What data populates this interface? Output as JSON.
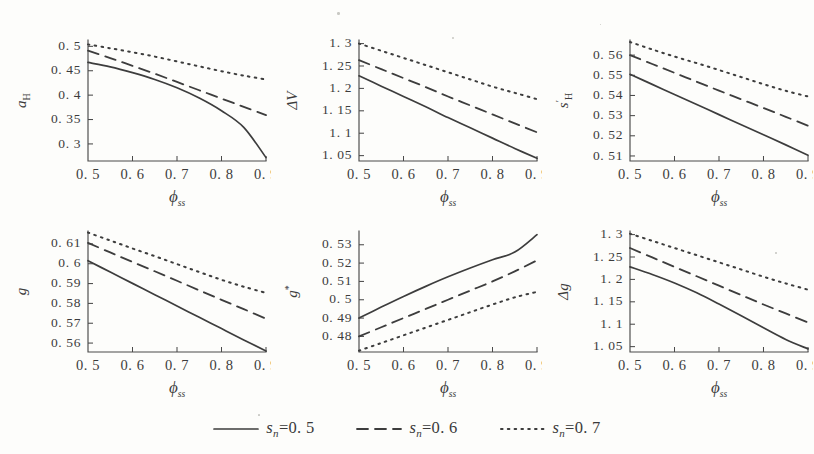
{
  "figure": {
    "background_color": "#fdfdfb",
    "ink_color": "#3d3d3d",
    "rows": 2,
    "columns": 3
  },
  "legend": {
    "position": "bottom-center",
    "items": [
      {
        "style": "solid",
        "label_symbol": "s",
        "label_sub": "n",
        "label_eq": "=0. 5",
        "full": "s_n=0.5",
        "value": 0.5
      },
      {
        "style": "dashed",
        "label_symbol": "s",
        "label_sub": "n",
        "label_eq": "=0. 6",
        "full": "s_n=0.6",
        "value": 0.6
      },
      {
        "style": "dotted",
        "label_symbol": "s",
        "label_sub": "n",
        "label_eq": "=0. 7",
        "full": "s_n=0.7",
        "value": 0.7
      }
    ]
  },
  "chart_data": [
    {
      "type": "line",
      "panel": 0,
      "title": "",
      "ylabel": "a_H",
      "ylabel_symbol": "a",
      "ylabel_sub": "H",
      "xlabel": "ϕ_ss",
      "xlabel_symbol": "ϕ",
      "xlabel_sub": "ss",
      "x": [
        0.5,
        0.55,
        0.6,
        0.65,
        0.7,
        0.75,
        0.8,
        0.85,
        0.9
      ],
      "xlim": [
        0.5,
        0.9
      ],
      "ylim": [
        0.265,
        0.513
      ],
      "xticks": [
        0.5,
        0.6,
        0.7,
        0.8,
        0.9
      ],
      "xticklabels": [
        "0. 5",
        "0. 6",
        "0. 7",
        "0. 8",
        "0. 9"
      ],
      "yticks": [
        0.3,
        0.35,
        0.4,
        0.45,
        0.5
      ],
      "yticklabels": [
        "0. 3",
        "0. 35",
        "0. 4",
        "0. 45",
        "0. 5"
      ],
      "grid": false,
      "series": [
        {
          "name": "s_n=0.5",
          "style": "solid",
          "values": [
            0.467,
            0.458,
            0.446,
            0.432,
            0.415,
            0.394,
            0.368,
            0.334,
            0.272
          ]
        },
        {
          "name": "s_n=0.6",
          "style": "dashed",
          "values": [
            0.491,
            0.476,
            0.46,
            0.444,
            0.427,
            0.41,
            0.393,
            0.376,
            0.359
          ]
        },
        {
          "name": "s_n=0.7",
          "style": "dotted",
          "values": [
            0.504,
            0.496,
            0.488,
            0.479,
            0.469,
            0.459,
            0.449,
            0.44,
            0.432
          ]
        }
      ]
    },
    {
      "type": "line",
      "panel": 1,
      "title": "",
      "ylabel": "ΔV",
      "ylabel_symbol": "ΔV",
      "ylabel_sub": "",
      "xlabel": "ϕ_ss",
      "xlabel_symbol": "ϕ",
      "xlabel_sub": "ss",
      "x": [
        0.5,
        0.55,
        0.6,
        0.65,
        0.7,
        0.75,
        0.8,
        0.85,
        0.9
      ],
      "xlim": [
        0.5,
        0.9
      ],
      "ylim": [
        1.038,
        1.308
      ],
      "xticks": [
        0.5,
        0.6,
        0.7,
        0.8,
        0.9
      ],
      "xticklabels": [
        "0. 5",
        "0. 6",
        "0. 7",
        "0. 8",
        "0. 9"
      ],
      "yticks": [
        1.05,
        1.1,
        1.15,
        1.2,
        1.25,
        1.3
      ],
      "yticklabels": [
        "1. 05",
        "1. 1",
        "1. 15",
        "1. 2",
        "1. 25",
        "1. 3"
      ],
      "grid": false,
      "series": [
        {
          "name": "s_n=0.5",
          "style": "solid",
          "values": [
            1.228,
            1.205,
            1.182,
            1.159,
            1.135,
            1.112,
            1.089,
            1.066,
            1.044
          ]
        },
        {
          "name": "s_n=0.6",
          "style": "dashed",
          "values": [
            1.263,
            1.243,
            1.223,
            1.203,
            1.182,
            1.162,
            1.142,
            1.122,
            1.102
          ]
        },
        {
          "name": "s_n=0.7",
          "style": "dotted",
          "values": [
            1.3,
            1.284,
            1.268,
            1.252,
            1.236,
            1.22,
            1.204,
            1.19,
            1.176
          ]
        }
      ]
    },
    {
      "type": "line",
      "panel": 2,
      "title": "",
      "ylabel": "s'_H",
      "ylabel_symbol": "s",
      "ylabel_sup": "′",
      "ylabel_sub": "H",
      "xlabel": "ϕ_ss",
      "xlabel_symbol": "ϕ",
      "xlabel_sub": "ss",
      "x": [
        0.5,
        0.55,
        0.6,
        0.65,
        0.7,
        0.75,
        0.8,
        0.85,
        0.9
      ],
      "xlim": [
        0.5,
        0.9
      ],
      "ylim": [
        0.5075,
        0.5675
      ],
      "xticks": [
        0.5,
        0.6,
        0.7,
        0.8,
        0.9
      ],
      "xticklabels": [
        "0. 5",
        "0. 6",
        "0. 7",
        "0. 8",
        "0. 9"
      ],
      "yticks": [
        0.51,
        0.52,
        0.53,
        0.54,
        0.55,
        0.56
      ],
      "yticklabels": [
        "0. 51",
        "0. 52",
        "0. 53",
        "0. 54",
        "0. 55",
        "0. 56"
      ],
      "grid": false,
      "series": [
        {
          "name": "s_n=0.5",
          "style": "solid",
          "values": [
            0.5505,
            0.5455,
            0.5405,
            0.5355,
            0.5305,
            0.5255,
            0.5205,
            0.5155,
            0.5103
          ]
        },
        {
          "name": "s_n=0.6",
          "style": "dashed",
          "values": [
            0.56,
            0.5556,
            0.5512,
            0.5468,
            0.5424,
            0.5381,
            0.5338,
            0.5294,
            0.525
          ]
        },
        {
          "name": "s_n=0.7",
          "style": "dotted",
          "values": [
            0.5665,
            0.5628,
            0.5593,
            0.556,
            0.5526,
            0.5491,
            0.5456,
            0.5423,
            0.5395
          ]
        }
      ]
    },
    {
      "type": "line",
      "panel": 3,
      "title": "",
      "ylabel": "g",
      "ylabel_symbol": "g",
      "ylabel_sub": "",
      "xlabel": "ϕ_ss",
      "xlabel_symbol": "ϕ",
      "xlabel_sub": "ss",
      "x": [
        0.5,
        0.55,
        0.6,
        0.65,
        0.7,
        0.75,
        0.8,
        0.85,
        0.9
      ],
      "xlim": [
        0.5,
        0.9
      ],
      "ylim": [
        0.5555,
        0.6165
      ],
      "xticks": [
        0.5,
        0.6,
        0.7,
        0.8,
        0.9
      ],
      "xticklabels": [
        "0. 5",
        "0. 6",
        "0. 7",
        "0. 8",
        "0. 9"
      ],
      "yticks": [
        0.56,
        0.57,
        0.58,
        0.59,
        0.6,
        0.61
      ],
      "yticklabels": [
        "0. 56",
        "0. 57",
        "0. 58",
        "0. 59",
        "0. 6",
        "0. 61"
      ],
      "grid": false,
      "series": [
        {
          "name": "s_n=0.5",
          "style": "solid",
          "values": [
            0.6015,
            0.5958,
            0.5901,
            0.5844,
            0.5787,
            0.573,
            0.5673,
            0.5616,
            0.556
          ]
        },
        {
          "name": "s_n=0.6",
          "style": "dashed",
          "values": [
            0.6105,
            0.6057,
            0.6009,
            0.5962,
            0.5914,
            0.5866,
            0.5818,
            0.5771,
            0.5723
          ]
        },
        {
          "name": "s_n=0.7",
          "style": "dotted",
          "values": [
            0.6157,
            0.6117,
            0.6077,
            0.6038,
            0.5998,
            0.5958,
            0.5919,
            0.5884,
            0.5853
          ]
        }
      ]
    },
    {
      "type": "line",
      "panel": 4,
      "title": "",
      "ylabel": "g*",
      "ylabel_symbol": "g",
      "ylabel_sup": "*",
      "ylabel_sub": "",
      "xlabel": "ϕ_ss",
      "xlabel_symbol": "ϕ",
      "xlabel_sub": "ss",
      "x": [
        0.5,
        0.55,
        0.6,
        0.65,
        0.7,
        0.75,
        0.8,
        0.85,
        0.9
      ],
      "xlim": [
        0.5,
        0.9
      ],
      "ylim": [
        0.4715,
        0.5375
      ],
      "xticks": [
        0.5,
        0.6,
        0.7,
        0.8,
        0.9
      ],
      "xticklabels": [
        "0. 5",
        "0. 6",
        "0. 7",
        "0. 8",
        "0. 9"
      ],
      "yticks": [
        0.48,
        0.49,
        0.5,
        0.51,
        0.52,
        0.53
      ],
      "yticklabels": [
        "0. 48",
        "0. 49",
        "0. 5",
        "0. 51",
        "0. 52",
        "0. 53"
      ],
      "grid": false,
      "series": [
        {
          "name": "s_n=0.5",
          "style": "solid",
          "values": [
            0.49,
            0.496,
            0.5018,
            0.5073,
            0.5125,
            0.5173,
            0.5218,
            0.526,
            0.5355
          ]
        },
        {
          "name": "s_n=0.6",
          "style": "dashed",
          "values": [
            0.48,
            0.485,
            0.49,
            0.495,
            0.5,
            0.505,
            0.51,
            0.5155,
            0.5215
          ]
        },
        {
          "name": "s_n=0.7",
          "style": "dotted",
          "values": [
            0.4722,
            0.4764,
            0.4806,
            0.4848,
            0.489,
            0.4932,
            0.4974,
            0.5013,
            0.5043
          ]
        }
      ]
    },
    {
      "type": "line",
      "panel": 5,
      "title": "",
      "ylabel": "Δg",
      "ylabel_symbol": "Δg",
      "ylabel_sub": "",
      "xlabel": "ϕ_ss",
      "xlabel_symbol": "ϕ",
      "xlabel_sub": "ss",
      "x": [
        0.5,
        0.55,
        0.6,
        0.65,
        0.7,
        0.75,
        0.8,
        0.85,
        0.9
      ],
      "xlim": [
        0.5,
        0.9
      ],
      "ylim": [
        1.038,
        1.308
      ],
      "xticks": [
        0.5,
        0.6,
        0.7,
        0.8,
        0.9
      ],
      "xticklabels": [
        "0. 5",
        "0. 6",
        "0. 7",
        "0. 8",
        "0. 9"
      ],
      "yticks": [
        1.05,
        1.1,
        1.15,
        1.2,
        1.25,
        1.3
      ],
      "yticklabels": [
        "1. 05",
        "1. 1",
        "1. 15",
        "1. 2",
        "1. 25",
        "1. 3"
      ],
      "grid": false,
      "series": [
        {
          "name": "s_n=0.5",
          "style": "solid",
          "values": [
            1.228,
            1.211,
            1.192,
            1.17,
            1.145,
            1.119,
            1.092,
            1.066,
            1.045
          ]
        },
        {
          "name": "s_n=0.6",
          "style": "dashed",
          "values": [
            1.27,
            1.249,
            1.228,
            1.207,
            1.186,
            1.165,
            1.144,
            1.124,
            1.104
          ]
        },
        {
          "name": "s_n=0.7",
          "style": "dotted",
          "values": [
            1.302,
            1.286,
            1.27,
            1.254,
            1.238,
            1.222,
            1.206,
            1.191,
            1.177
          ]
        }
      ]
    }
  ]
}
